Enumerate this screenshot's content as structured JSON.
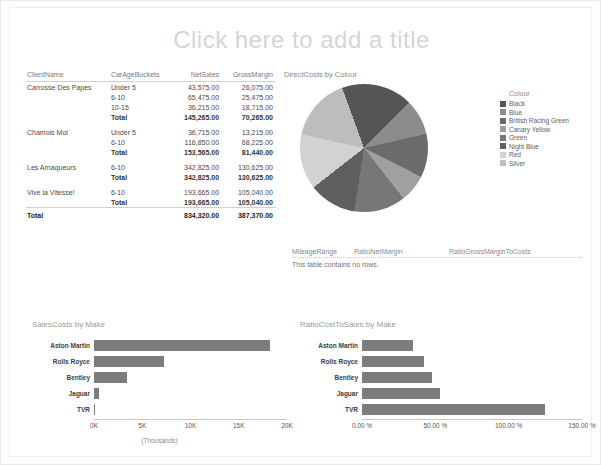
{
  "report": {
    "title_placeholder": "Click here to add a title"
  },
  "matrix": {
    "columns": [
      "ClientName",
      "CarAgeBuckets",
      "NetSales",
      "GrossMargin"
    ],
    "rows": [
      {
        "client": "Carrosse Des Papes",
        "bucket": "Under 5",
        "net": "43,575.00",
        "gross": "26,075.00",
        "style": "normal"
      },
      {
        "client": "",
        "bucket": "6-10",
        "net": "65,475.00",
        "gross": "25,475.00",
        "style": "normal"
      },
      {
        "client": "",
        "bucket": "10-15",
        "net": "36,215.00",
        "gross": "18,715.00",
        "style": "normal"
      },
      {
        "client": "",
        "bucket": "Total",
        "net": "145,265.00",
        "gross": "70,265.00",
        "style": "sub"
      },
      {
        "client": "Chamois Mol",
        "bucket": "Under 5",
        "net": "36,715.00",
        "gross": "13,215.00",
        "style": "normal"
      },
      {
        "client": "",
        "bucket": "6-10",
        "net": "116,850.00",
        "gross": "68,225.00",
        "style": "normal"
      },
      {
        "client": "",
        "bucket": "Total",
        "net": "153,565.00",
        "gross": "81,440.00",
        "style": "sub"
      },
      {
        "client": "Les Arnaqueurs",
        "bucket": "6-10",
        "net": "342,825.00",
        "gross": "130,625.00",
        "style": "normal"
      },
      {
        "client": "",
        "bucket": "Total",
        "net": "342,825.00",
        "gross": "130,625.00",
        "style": "sub"
      },
      {
        "client": "Vive la Vitesse!",
        "bucket": "6-10",
        "net": "193,665.00",
        "gross": "105,040.00",
        "style": "normal"
      },
      {
        "client": "",
        "bucket": "Total",
        "net": "193,665.00",
        "gross": "105,040.00",
        "style": "sub"
      }
    ],
    "grand_total": {
      "label": "Total",
      "net": "834,320.00",
      "gross": "387,370.00"
    }
  },
  "empty_table": {
    "columns": [
      "MileageRange",
      "RatioNetMargin",
      "RatioGrossMarginToCosts"
    ],
    "message": "This table contains no rows."
  },
  "chart_data": [
    {
      "type": "pie",
      "title": "DirectCosts by Colour",
      "legend_title": "Colour",
      "legend_position": "right",
      "categories": [
        "Black",
        "Blue",
        "British Racing Green",
        "Canary Yellow",
        "Green",
        "Night Blue",
        "Red",
        "Silver"
      ],
      "values": [
        18,
        9,
        11,
        7,
        13,
        12,
        14,
        16
      ],
      "colors": [
        "#555555",
        "#8c8c8c",
        "#6b6b6b",
        "#a0a0a0",
        "#777777",
        "#5f5f5f",
        "#d2d2d2",
        "#bdbdbd"
      ]
    },
    {
      "type": "bar",
      "orientation": "horizontal",
      "title": "SalesCosts by Make",
      "categories": [
        "Aston Martin",
        "Rolls Royce",
        "Bentley",
        "Jaguar",
        "TVR"
      ],
      "values": [
        18.2,
        7.3,
        3.4,
        0.55,
        0.06
      ],
      "xlabel": "(Thousands)",
      "ylabel": "",
      "xlim": [
        0,
        20
      ],
      "ticks": [
        "0K",
        "5K",
        "10K",
        "15K",
        "20K"
      ],
      "bar_color": "#7d7d7d"
    },
    {
      "type": "bar",
      "orientation": "horizontal",
      "title": "RatioCostToSales by Make",
      "categories": [
        "Aston Martin",
        "Rolls Royce",
        "Bentley",
        "Jaguar",
        "TVR"
      ],
      "values": [
        35.0,
        42.0,
        48.0,
        53.0,
        125.0
      ],
      "xlabel": "",
      "ylabel": "",
      "xlim": [
        0,
        150
      ],
      "ticks": [
        "0.00 %",
        "50.00 %",
        "100.00 %",
        "150.00 %"
      ],
      "bar_color": "#7d7d7d"
    }
  ]
}
